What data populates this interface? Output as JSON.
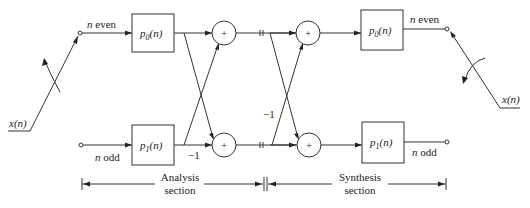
{
  "diagram": {
    "type": "polyphase-analysis-synthesis-filter-bank",
    "input": {
      "label": "x(n)"
    },
    "output": {
      "label": "x(n)"
    },
    "analysis_branches": {
      "top": {
        "label": "n even",
        "block": "p0(n)",
        "block_main": "p",
        "block_sub": "0",
        "block_arg": "(n)"
      },
      "bottom": {
        "label": "n odd",
        "block": "p1(n)",
        "block_main": "p",
        "block_sub": "1",
        "block_arg": "(n)"
      }
    },
    "analysis_gain": "−1",
    "synthesis_gain": "−1",
    "adders": [
      {
        "id": "analysis-top",
        "symbol": "+"
      },
      {
        "id": "analysis-bottom",
        "symbol": "+"
      },
      {
        "id": "synthesis-top",
        "symbol": "+"
      },
      {
        "id": "synthesis-bottom",
        "symbol": "+"
      }
    ],
    "synthesis_branches": {
      "top": {
        "label": "n even",
        "block": "p0(n)",
        "block_main": "p",
        "block_sub": "0",
        "block_arg": "(n)"
      },
      "bottom": {
        "label": "n odd",
        "block": "p1(n)",
        "block_main": "p",
        "block_sub": "1",
        "block_arg": "(n)"
      }
    },
    "sections": {
      "analysis": {
        "line1": "Analysis",
        "line2": "section"
      },
      "synthesis": {
        "line1": "Synthesis",
        "line2": "section"
      }
    }
  }
}
